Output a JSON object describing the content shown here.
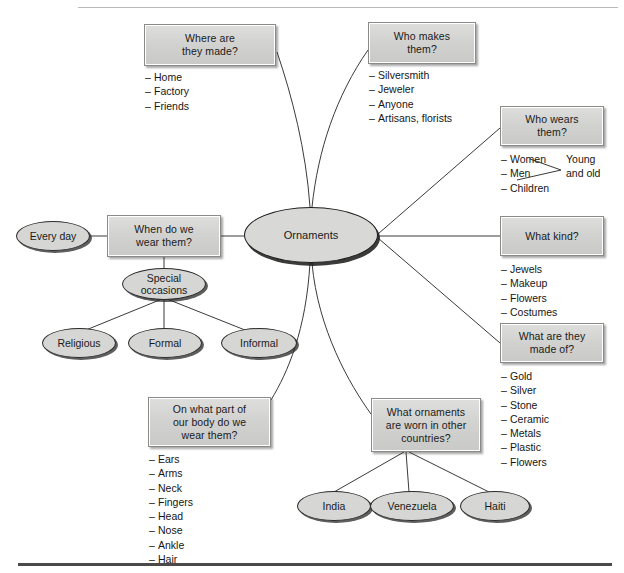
{
  "diagram": {
    "center": {
      "label": "Ornaments"
    },
    "colors": {
      "box_fill": "#d2d2d0",
      "box_border": "#8a8a88",
      "ellipse_fill": "#d6d6d4",
      "ellipse_border": "#2b2b2b",
      "line": "#3a3a3a",
      "text": "#1a1a1a",
      "rule_top": "#b9b9b9",
      "rule_bottom": "#4a4a4a"
    },
    "branches": [
      {
        "id": "where-made",
        "question": "Where are\nthey made?",
        "items": [
          "Home",
          "Factory",
          "Friends"
        ]
      },
      {
        "id": "who-makes",
        "question": "Who makes\nthem?",
        "items": [
          "Silversmith",
          "Jeweler",
          "Anyone",
          "Artisans, florists"
        ]
      },
      {
        "id": "who-wears",
        "question": "Who wears\nthem?",
        "items": [
          "Women",
          "Men",
          "Children"
        ],
        "annotation": "Young\nand old"
      },
      {
        "id": "what-kind",
        "question": "What kind?",
        "items": [
          "Jewels",
          "Makeup",
          "Flowers",
          "Costumes"
        ]
      },
      {
        "id": "made-of",
        "question": "What are they\nmade of?",
        "items": [
          "Gold",
          "Silver",
          "Stone",
          "Ceramic",
          "Metals",
          "Plastic",
          "Flowers"
        ]
      },
      {
        "id": "other-countries",
        "question": "What ornaments\nare worn in other\ncountries?",
        "items": [],
        "children": [
          "India",
          "Venezuela",
          "Haiti"
        ]
      },
      {
        "id": "body-part",
        "question": "On what part of\nour body do we\nwear them?",
        "items": [
          "Ears",
          "Arms",
          "Neck",
          "Fingers",
          "Head",
          "Nose",
          "Ankle",
          "Hair"
        ]
      },
      {
        "id": "when-wear",
        "question": "When do we\nwear them?",
        "items": [],
        "left_child": "Every day",
        "sub": {
          "label": "Special\noccasions",
          "children": [
            "Religious",
            "Formal",
            "Informal"
          ]
        }
      }
    ]
  }
}
